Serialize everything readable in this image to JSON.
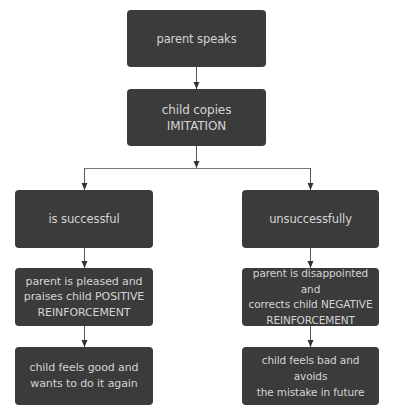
{
  "diagram": {
    "colors": {
      "box_fill": "#3b3b3b",
      "box_text": "#d4d4d4",
      "connector": "#444444",
      "background": "#ffffff"
    },
    "nodes": {
      "parent_speaks": {
        "text": "parent speaks"
      },
      "child_copies": {
        "text": "child copies\nIMITATION"
      },
      "is_successful": {
        "text": "is successful"
      },
      "unsuccessfully": {
        "text": "unsuccessfully"
      },
      "positive_reinforcement": {
        "text": "parent is pleased and\npraises child POSITIVE\nREINFORCEMENT"
      },
      "negative_reinforcement": {
        "text": "parent is disappointed and\ncorrects child NEGATIVE\nREINFORCEMENT"
      },
      "feels_good": {
        "text": "child feels good and\nwants to do it again"
      },
      "feels_bad": {
        "text": "child feels bad and avoids\nthe mistake in future"
      }
    },
    "edges": [
      {
        "from": "parent_speaks",
        "to": "child_copies"
      },
      {
        "from": "child_copies",
        "to": "is_successful"
      },
      {
        "from": "child_copies",
        "to": "unsuccessfully"
      },
      {
        "from": "is_successful",
        "to": "positive_reinforcement"
      },
      {
        "from": "unsuccessfully",
        "to": "negative_reinforcement"
      },
      {
        "from": "positive_reinforcement",
        "to": "feels_good"
      },
      {
        "from": "negative_reinforcement",
        "to": "feels_bad"
      }
    ]
  }
}
